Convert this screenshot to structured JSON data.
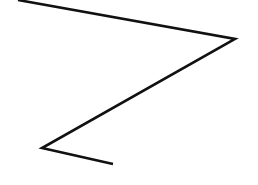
{
  "canvas": {
    "width": 258,
    "height": 185,
    "background": "#ffffff"
  },
  "stroke": {
    "color": "#111111",
    "width": 2.6
  },
  "polyline": {
    "points": [
      [
        18,
        0
      ],
      [
        235,
        39
      ],
      [
        42,
        148
      ],
      [
        113,
        164
      ]
    ]
  }
}
